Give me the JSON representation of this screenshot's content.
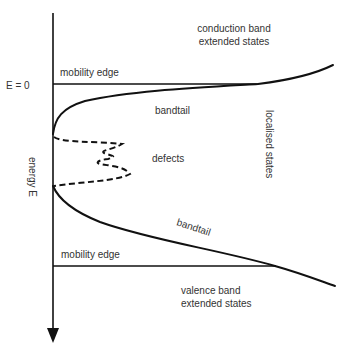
{
  "diagram": {
    "axis": {
      "label": "energy E",
      "zero_label": "E = 0",
      "direction": "down"
    },
    "labels": {
      "conduction_band_line1": "conduction band",
      "conduction_band_line2": "extended states",
      "mobility_edge_upper": "mobility edge",
      "bandtail_upper": "bandtail",
      "defects": "defects",
      "localised_states": "localised states",
      "bandtail_lower": "bandtail",
      "mobility_edge_lower": "mobility edge",
      "valence_band_line1": "valence band",
      "valence_band_line2": "extended states"
    },
    "colors": {
      "stroke": "#111111",
      "text": "#333333",
      "background": "#ffffff"
    }
  }
}
